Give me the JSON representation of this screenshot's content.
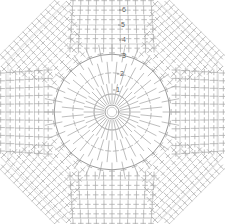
{
  "document": {
    "title": "Crochet Octagon Motif Chart",
    "kind": "crochet-pattern-diagram",
    "background_color": "#ffffff",
    "line_color": "#a8a8a8",
    "line_color_dark": "#8d8d8d",
    "label_color": "#5a5a5a",
    "width": 225,
    "height": 224
  },
  "chart_data": {
    "type": "diagram",
    "subtype": "crochet-stitch-symbol-chart",
    "shape": "octagon",
    "symmetry": "4-fold rotational",
    "center": {
      "x": 112,
      "y": 112,
      "ring_radius": 7,
      "symbol": "magic-ring"
    },
    "stitch_symbol": "double-crochet",
    "stitch_symbol_description": "vertical stem with horizontal crossbar",
    "rounds": [
      {
        "number": "1",
        "label_x": 118,
        "label_y": 90,
        "radius": 20
      },
      {
        "number": "2",
        "label_x": 122,
        "label_y": 74,
        "radius": 36
      },
      {
        "number": "3",
        "label_x": 124,
        "label_y": 56,
        "radius": 55
      },
      {
        "number": "4",
        "label_x": 124,
        "label_y": 40,
        "radius": 72
      },
      {
        "number": "5",
        "label_x": 123,
        "label_y": 25,
        "radius": 88
      },
      {
        "number": "6",
        "label_x": 124,
        "label_y": 10,
        "radius": 104
      }
    ],
    "round_count": 6,
    "regions": [
      {
        "name": "center-ring",
        "description": "small open magic ring at center"
      },
      {
        "name": "radial-spokes",
        "description": "stitches radiating outward from center ring",
        "count": 32
      },
      {
        "name": "inner-arcs",
        "description": "four curved arcs forming rounded square",
        "count": 4
      },
      {
        "name": "corner-fans",
        "description": "diagonal stitch fans at the four octagon corners",
        "count": 4
      },
      {
        "name": "edge-rows",
        "description": "straight parallel rows of double crochet along top, bottom, left and right edges",
        "count": 4
      }
    ],
    "octagon_bounds": {
      "left": 8,
      "top": 6,
      "right": 217,
      "bottom": 218,
      "corner_cut": 56
    },
    "grid": false,
    "legend": null,
    "xlabel": "",
    "ylabel": ""
  }
}
